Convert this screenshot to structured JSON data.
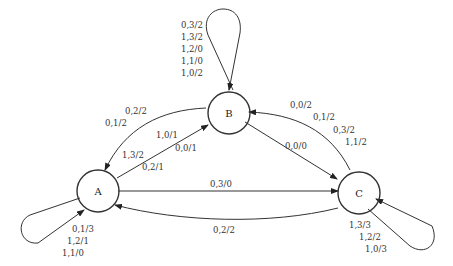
{
  "diagram": {
    "type": "finite-state-machine",
    "nodes": [
      {
        "id": "A",
        "label": "A"
      },
      {
        "id": "B",
        "label": "B"
      },
      {
        "id": "C",
        "label": "C"
      }
    ],
    "edges": [
      {
        "from": "B",
        "to": "B",
        "labels": [
          "0,3/2",
          "1,3/2",
          "1,2/0",
          "1,1/0",
          "1,0/2"
        ]
      },
      {
        "from": "B",
        "to": "A",
        "labels": [
          "0,2/2",
          "0,1/2"
        ]
      },
      {
        "from": "A",
        "to": "B",
        "labels": [
          "1,0/1",
          "0,0/1",
          "1,3/2",
          "0,2/1"
        ]
      },
      {
        "from": "B",
        "to": "C",
        "labels": [
          "0,0/0"
        ]
      },
      {
        "from": "C",
        "to": "B",
        "labels": [
          "0,0/2",
          "0,1/2",
          "0,3/2",
          "1,1/2"
        ]
      },
      {
        "from": "A",
        "to": "C",
        "labels": [
          "0,3/0"
        ]
      },
      {
        "from": "C",
        "to": "A",
        "labels": [
          "0,2/2"
        ]
      },
      {
        "from": "A",
        "to": "A",
        "labels": [
          "0,1/3",
          "1,2/1",
          "1,1/0"
        ]
      },
      {
        "from": "C",
        "to": "C",
        "labels": [
          "1,3/3",
          "1,2/2",
          "1,0/3"
        ]
      }
    ]
  }
}
